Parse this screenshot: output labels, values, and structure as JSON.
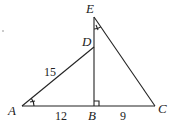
{
  "diagram": {
    "points": {
      "A": {
        "label": "A"
      },
      "B": {
        "label": "B"
      },
      "C": {
        "label": "C"
      },
      "D": {
        "label": "D"
      },
      "E": {
        "label": "E"
      }
    },
    "lengths": {
      "AD": "15",
      "AB": "12",
      "BC": "9"
    },
    "marks": [
      "angle A congruent to angle E",
      "right angle at B"
    ]
  }
}
